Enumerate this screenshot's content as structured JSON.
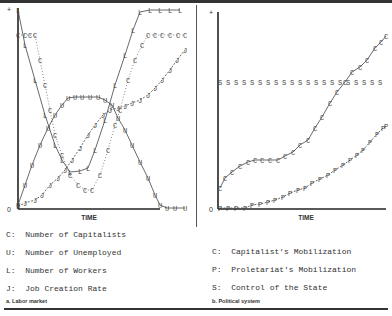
{
  "chart_data": [
    {
      "type": "line",
      "panel": "a",
      "title": "a. Labor market",
      "xlabel": "TIME",
      "ylabel": "",
      "y_ticks": [
        "0",
        "+"
      ],
      "grid": false,
      "series": [
        {
          "name": "L",
          "label": "Number of Workers",
          "style": "solid",
          "points": [
            [
              18,
              10
            ],
            [
              25,
              45
            ],
            [
              35,
              80
            ],
            [
              45,
              115
            ],
            [
              55,
              145
            ],
            [
              62,
              160
            ],
            [
              70,
              172
            ],
            [
              80,
              171
            ],
            [
              88,
              168
            ],
            [
              95,
              150
            ],
            [
              105,
              120
            ],
            [
              115,
              85
            ],
            [
              125,
              55
            ],
            [
              133,
              30
            ],
            [
              140,
              12
            ],
            [
              150,
              10
            ],
            [
              160,
              10
            ],
            [
              170,
              10
            ],
            [
              180,
              10
            ]
          ]
        },
        {
          "name": "C",
          "label": "Number of Capitalists",
          "style": "dotted",
          "points": [
            [
              18,
              35
            ],
            [
              25,
              35
            ],
            [
              30,
              35
            ],
            [
              35,
              35
            ],
            [
              40,
              60
            ],
            [
              45,
              85
            ],
            [
              50,
              110
            ],
            [
              55,
              135
            ],
            [
              62,
              155
            ],
            [
              70,
              175
            ],
            [
              78,
              185
            ],
            [
              85,
              190
            ],
            [
              92,
              190
            ],
            [
              100,
              175
            ],
            [
              108,
              150
            ],
            [
              115,
              125
            ],
            [
              120,
              110
            ],
            [
              128,
              80
            ],
            [
              135,
              60
            ],
            [
              142,
              45
            ],
            [
              148,
              35
            ],
            [
              155,
              35
            ],
            [
              162,
              35
            ],
            [
              170,
              35
            ],
            [
              178,
              35
            ],
            [
              185,
              35
            ]
          ]
        },
        {
          "name": "U",
          "label": "Number of Unemployed",
          "style": "solid",
          "points": [
            [
              18,
              205
            ],
            [
              25,
              185
            ],
            [
              32,
              165
            ],
            [
              40,
              145
            ],
            [
              48,
              128
            ],
            [
              55,
              115
            ],
            [
              62,
              105
            ],
            [
              68,
              98
            ],
            [
              75,
              97
            ],
            [
              82,
              97
            ],
            [
              90,
              97
            ],
            [
              98,
              97
            ],
            [
              105,
              100
            ],
            [
              112,
              105
            ],
            [
              118,
              118
            ],
            [
              125,
              130
            ],
            [
              132,
              145
            ],
            [
              140,
              162
            ],
            [
              148,
              178
            ],
            [
              155,
              195
            ],
            [
              160,
              205
            ],
            [
              167,
              208
            ],
            [
              175,
              208
            ],
            [
              185,
              208
            ]
          ]
        },
        {
          "name": "J",
          "label": "Job Creation Rate",
          "style": "dashed",
          "points": [
            [
              18,
              206
            ],
            [
              25,
              203
            ],
            [
              35,
              200
            ],
            [
              42,
              195
            ],
            [
              50,
              185
            ],
            [
              58,
              178
            ],
            [
              65,
              170
            ],
            [
              72,
              160
            ],
            [
              80,
              148
            ],
            [
              88,
              135
            ],
            [
              95,
              125
            ],
            [
              103,
              115
            ],
            [
              110,
              110
            ],
            [
              118,
              108
            ],
            [
              125,
              106
            ],
            [
              132,
              103
            ],
            [
              140,
              100
            ],
            [
              148,
              95
            ],
            [
              155,
              88
            ],
            [
              162,
              80
            ],
            [
              170,
              70
            ],
            [
              177,
              60
            ],
            [
              185,
              50
            ]
          ]
        }
      ]
    },
    {
      "type": "line",
      "panel": "b",
      "title": "b. Political system",
      "xlabel": "TIME",
      "ylabel": "",
      "y_ticks": [
        "0",
        "+"
      ],
      "grid": false,
      "series": [
        {
          "name": "C",
          "label": "Capitalist's Mobilization",
          "style": "solid",
          "points": [
            [
              220,
              188
            ],
            [
              225,
              178
            ],
            [
              232,
              172
            ],
            [
              240,
              166
            ],
            [
              248,
              162
            ],
            [
              255,
              160
            ],
            [
              262,
              160
            ],
            [
              270,
              160
            ],
            [
              278,
              160
            ],
            [
              285,
              156
            ],
            [
              293,
              152
            ],
            [
              300,
              145
            ],
            [
              308,
              140
            ],
            [
              315,
              128
            ],
            [
              322,
              117
            ],
            [
              330,
              103
            ],
            [
              337,
              92
            ],
            [
              345,
              82
            ],
            [
              352,
              72
            ],
            [
              360,
              67
            ],
            [
              367,
              60
            ],
            [
              375,
              48
            ],
            [
              381,
              42
            ],
            [
              386,
              36
            ]
          ]
        },
        {
          "name": "P",
          "label": "Proletariat's Mobilization",
          "style": "dashed",
          "points": [
            [
              220,
              208
            ],
            [
              228,
              208
            ],
            [
              236,
              208
            ],
            [
              245,
              208
            ],
            [
              252,
              205
            ],
            [
              260,
              204
            ],
            [
              268,
              202
            ],
            [
              275,
              200
            ],
            [
              283,
              197
            ],
            [
              290,
              193
            ],
            [
              298,
              190
            ],
            [
              305,
              188
            ],
            [
              312,
              183
            ],
            [
              320,
              179
            ],
            [
              328,
              175
            ],
            [
              335,
              170
            ],
            [
              343,
              165
            ],
            [
              350,
              160
            ],
            [
              357,
              155
            ],
            [
              363,
              150
            ],
            [
              370,
              142
            ],
            [
              377,
              134
            ],
            [
              383,
              128
            ],
            [
              386,
              126
            ]
          ]
        },
        {
          "name": "S",
          "label": "Control of the State",
          "style": "none",
          "points": [
            [
              220,
              82
            ],
            [
              228,
              82
            ],
            [
              236,
              82
            ],
            [
              244,
              82
            ],
            [
              252,
              82
            ],
            [
              260,
              82
            ],
            [
              268,
              82
            ],
            [
              276,
              82
            ],
            [
              284,
              82
            ],
            [
              292,
              82
            ],
            [
              300,
              82
            ],
            [
              308,
              82
            ],
            [
              316,
              82
            ],
            [
              324,
              82
            ],
            [
              332,
              82
            ],
            [
              340,
              82
            ],
            [
              348,
              82
            ],
            [
              356,
              82
            ],
            [
              364,
              82
            ],
            [
              372,
              82
            ],
            [
              380,
              82
            ]
          ]
        }
      ]
    }
  ],
  "left_panel": {
    "axis_plus": "+",
    "axis_zero": "0",
    "xlabel": "TIME",
    "legend": [
      {
        "key": "C:",
        "text": "Number of Capitalists"
      },
      {
        "key": "U:",
        "text": "Number of Unemployed"
      },
      {
        "key": "L:",
        "text": "Number of Workers"
      },
      {
        "key": "J:",
        "text": "Job Creation Rate"
      }
    ],
    "caption": "a. Labor market"
  },
  "right_panel": {
    "axis_plus": "+",
    "axis_zero": "0",
    "xlabel": "TIME",
    "legend": [
      {
        "key": "C:",
        "text": "Capitalist's Mobilization"
      },
      {
        "key": "P:",
        "text": "Proletariat's Mobilization"
      },
      {
        "key": "S:",
        "text": "Control of the State"
      }
    ],
    "caption": "b. Political system"
  },
  "colors": {
    "ink": "#333333",
    "background": "#ffffff"
  }
}
